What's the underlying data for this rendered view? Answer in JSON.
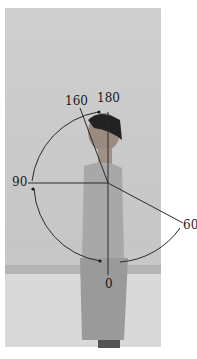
{
  "figure": {
    "angle_labels": {
      "a180": "180",
      "a160": "160",
      "a90": "90",
      "a60": "60",
      "a0": "0"
    },
    "colors": {
      "lines": "#2a2a2a",
      "background": "#c9c9c9"
    }
  }
}
